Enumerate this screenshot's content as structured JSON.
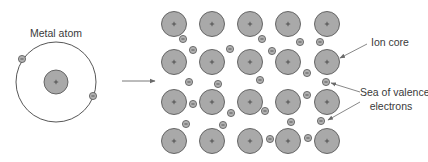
{
  "labels": {
    "metal_atom": "Metal atom",
    "ion_core": "Ion core",
    "sea_line1": "Sea of valence",
    "sea_line2": "electrons"
  },
  "symbols": {
    "ion_sign": "+",
    "electron_sign": "−"
  },
  "colors": {
    "ion_fill": "#a9a9a9",
    "ion_stroke": "#5a5a5a",
    "electron_fill": "#b0b0b0",
    "electron_stroke": "#555555",
    "line": "#6a6a6a",
    "text": "#3a3a3a"
  },
  "metal_atom": {
    "orbit": {
      "cx": 56,
      "cy": 82,
      "r": 40
    },
    "nucleus": {
      "cx": 56,
      "cy": 82,
      "r": 12
    },
    "electrons": [
      {
        "cx": 22,
        "cy": 59
      },
      {
        "cx": 93,
        "cy": 96
      }
    ]
  },
  "transition_arrow": {
    "x1": 122,
    "y1": 81,
    "x2": 155,
    "y2": 81
  },
  "lattice": {
    "ion_radius": 12.5,
    "electron_radius": 3.6,
    "columns_x": [
      174,
      212,
      250,
      288,
      327
    ],
    "rows_y": [
      24,
      62,
      102,
      141
    ],
    "electrons": [
      {
        "cx": 183,
        "cy": 39
      },
      {
        "cx": 193,
        "cy": 50
      },
      {
        "cx": 230,
        "cy": 49
      },
      {
        "cx": 262,
        "cy": 39
      },
      {
        "cx": 272,
        "cy": 51
      },
      {
        "cx": 300,
        "cy": 42
      },
      {
        "cx": 320,
        "cy": 42
      },
      {
        "cx": 189,
        "cy": 82
      },
      {
        "cx": 218,
        "cy": 84
      },
      {
        "cx": 260,
        "cy": 80
      },
      {
        "cx": 307,
        "cy": 73
      },
      {
        "cx": 326,
        "cy": 82
      },
      {
        "cx": 193,
        "cy": 104
      },
      {
        "cx": 231,
        "cy": 113
      },
      {
        "cx": 265,
        "cy": 111
      },
      {
        "cx": 307,
        "cy": 95
      },
      {
        "cx": 186,
        "cy": 124
      },
      {
        "cx": 223,
        "cy": 125
      },
      {
        "cx": 291,
        "cy": 122
      },
      {
        "cx": 321,
        "cy": 121
      },
      {
        "cx": 270,
        "cy": 139
      },
      {
        "cx": 308,
        "cy": 138
      }
    ]
  },
  "callouts": [
    {
      "name": "ion-core-leader",
      "x1": 367,
      "y1": 44,
      "x2": 340,
      "y2": 58
    },
    {
      "name": "sea-leader-upper",
      "x1": 360,
      "y1": 92,
      "x2": 331,
      "y2": 83
    },
    {
      "name": "sea-leader-lower",
      "x1": 360,
      "y1": 102,
      "x2": 328,
      "y2": 120
    }
  ]
}
